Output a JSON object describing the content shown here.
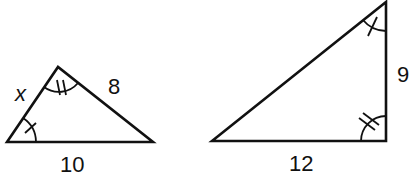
{
  "figure": {
    "stroke_color": "#111111",
    "triangles": [
      {
        "id": "left",
        "vertices": [
          [
            7,
            142
          ],
          [
            58,
            67
          ],
          [
            153,
            142
          ]
        ],
        "labels": {
          "left_side": "x",
          "right_side": "8",
          "base": "10"
        },
        "angle_marks": [
          {
            "vertex": "bottom-left",
            "ticks": 1
          },
          {
            "vertex": "apex",
            "ticks": 2
          }
        ]
      },
      {
        "id": "right",
        "vertices": [
          [
            212,
            141
          ],
          [
            386,
            2
          ],
          [
            386,
            141
          ]
        ],
        "labels": {
          "vertical_side": "9",
          "base": "12"
        },
        "angle_marks": [
          {
            "vertex": "top-right",
            "ticks": 1
          },
          {
            "vertex": "bottom-right",
            "ticks": 2
          }
        ]
      }
    ]
  }
}
